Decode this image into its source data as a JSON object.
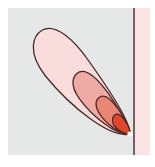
{
  "diagram": {
    "type": "lobe-contour-diagram",
    "colors": {
      "background": "#ffffff",
      "left_region": "#e6e8e8",
      "right_region": "#fbe4e4",
      "boundary_line": "#3a2a2a",
      "contour_stroke": "#4a2626",
      "lobe_1_fill": "#f9dcdc",
      "lobe_2_fill": "#efaaa3",
      "lobe_3_fill": "#e98774",
      "lobe_4_fill": "#e0472c",
      "source_point": "#ffffff"
    },
    "source_point": {
      "x": 130,
      "y": 134
    },
    "lobes": [
      {
        "name": "outer",
        "level": 1
      },
      {
        "name": "second",
        "level": 2
      },
      {
        "name": "third",
        "level": 3
      },
      {
        "name": "inner",
        "level": 4
      }
    ]
  }
}
